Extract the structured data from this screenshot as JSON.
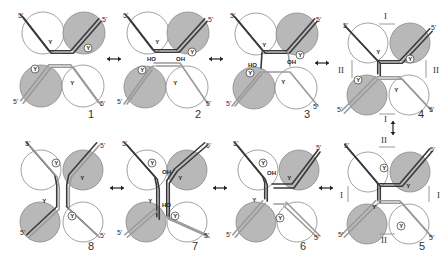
{
  "figure": {
    "colors": {
      "background": "#ffffff",
      "circle_open_fill": "#ffffff",
      "circle_shaded_fill": "#b8b8b8",
      "circle_stroke": "#8a8a8a",
      "strand_dark": "#3a3a3a",
      "strand_light": "#9a9a9a",
      "strand_gap": "#ffffff",
      "text": "#333333"
    },
    "labels": {
      "five_prime": "5'",
      "tyrosine": "Y",
      "hydroxyl_left": "HO",
      "hydroxyl_right": "OH",
      "roman_one": "I",
      "roman_two": "II",
      "bidirectional_arrow": "↔"
    },
    "panels": [
      {
        "id": 1,
        "number": "1",
        "row": "top",
        "state": "synaptic complex, strands paired"
      },
      {
        "id": 2,
        "number": "2",
        "row": "top",
        "state": "first strand cleavage, 5'-OH free"
      },
      {
        "id": 3,
        "number": "3",
        "row": "top",
        "state": "strand exchange initiated"
      },
      {
        "id": 4,
        "number": "4",
        "row": "top",
        "state": "Holliday junction, isomer I/II axes"
      },
      {
        "id": 5,
        "number": "5",
        "row": "bottom",
        "state": "Holliday junction isomerized"
      },
      {
        "id": 6,
        "number": "6",
        "row": "bottom",
        "state": "second strand cleavage"
      },
      {
        "id": 7,
        "number": "7",
        "row": "bottom",
        "state": "second strand exchange"
      },
      {
        "id": 8,
        "number": "8",
        "row": "bottom",
        "state": "recombinant products"
      }
    ],
    "arrows": [
      {
        "from": 1,
        "to": 2,
        "glyph": "↔"
      },
      {
        "from": 2,
        "to": 3,
        "glyph": "↔"
      },
      {
        "from": 3,
        "to": 4,
        "glyph": "↔"
      },
      {
        "from": 4,
        "to": 5,
        "glyph": "↕"
      },
      {
        "from": 5,
        "to": 6,
        "glyph": "↔"
      },
      {
        "from": 6,
        "to": 7,
        "glyph": "↔"
      },
      {
        "from": 7,
        "to": 8,
        "glyph": "↔"
      }
    ]
  }
}
